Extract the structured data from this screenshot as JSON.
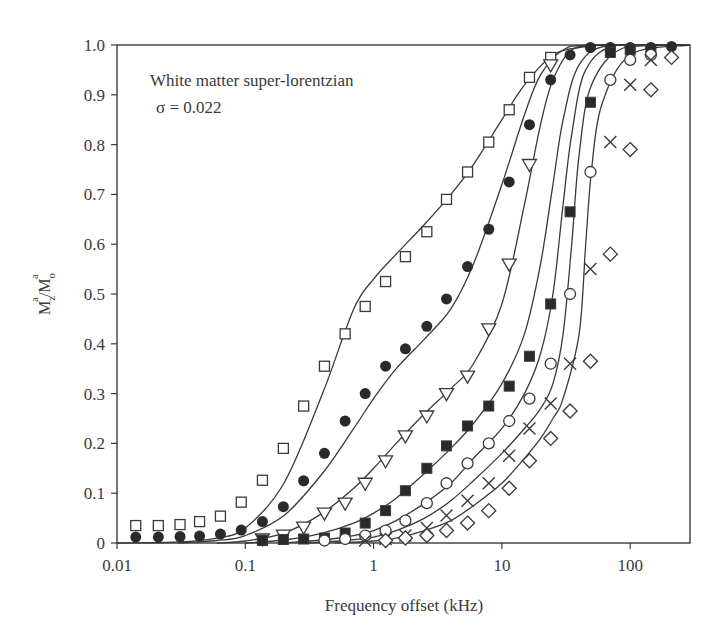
{
  "chart_data": {
    "type": "scatter",
    "title": "",
    "annotation": [
      "White matter super-lorentzian",
      "σ = 0.022"
    ],
    "xlabel": "Frequency offset (kHz)",
    "ylabel": "M_z^a/M_o^a",
    "xscale": "log",
    "xlim": [
      0.01,
      290
    ],
    "ylim": [
      0,
      1.0
    ],
    "xticks": [
      "0.01",
      "0.1",
      "1",
      "10",
      "100"
    ],
    "yticks": [
      "0",
      "0.1",
      "0.2",
      "0.3",
      "0.4",
      "0.5",
      "0.6",
      "0.7",
      "0.8",
      "0.9",
      "1.0"
    ],
    "grid": false,
    "legend": null,
    "series": [
      {
        "name": "open-square",
        "marker": "square-open",
        "x": [
          0.014,
          0.021,
          0.031,
          0.044,
          0.064,
          0.093,
          0.136,
          0.198,
          0.285,
          0.414,
          0.6,
          0.86,
          1.24,
          1.77,
          2.6,
          3.7,
          5.4,
          7.9,
          11.4,
          16.4,
          24
        ],
        "y": [
          0.035,
          0.035,
          0.037,
          0.043,
          0.054,
          0.082,
          0.126,
          0.19,
          0.275,
          0.355,
          0.42,
          0.475,
          0.525,
          0.575,
          0.625,
          0.69,
          0.745,
          0.805,
          0.87,
          0.935,
          0.975
        ]
      },
      {
        "name": "filled-circle",
        "marker": "circle-filled",
        "x": [
          0.014,
          0.021,
          0.031,
          0.044,
          0.064,
          0.093,
          0.136,
          0.198,
          0.285,
          0.414,
          0.6,
          0.86,
          1.24,
          1.77,
          2.6,
          3.7,
          5.4,
          7.9,
          11.4,
          16.4,
          24,
          34,
          49,
          70,
          100,
          145,
          210
        ],
        "y": [
          0.012,
          0.012,
          0.013,
          0.014,
          0.018,
          0.026,
          0.043,
          0.073,
          0.125,
          0.18,
          0.245,
          0.3,
          0.355,
          0.39,
          0.435,
          0.49,
          0.555,
          0.63,
          0.725,
          0.84,
          0.93,
          0.98,
          0.995,
          0.995,
          0.995,
          0.995,
          0.997
        ]
      },
      {
        "name": "open-triangle-down",
        "marker": "triangle-down-open",
        "x": [
          0.136,
          0.198,
          0.285,
          0.414,
          0.6,
          0.86,
          1.24,
          1.77,
          2.6,
          3.7,
          5.4,
          7.9,
          11.4,
          16.4,
          24
        ],
        "y": [
          0.008,
          0.016,
          0.032,
          0.06,
          0.08,
          0.12,
          0.165,
          0.215,
          0.255,
          0.3,
          0.335,
          0.43,
          0.56,
          0.76,
          0.96
        ]
      },
      {
        "name": "filled-square",
        "marker": "square-filled",
        "x": [
          0.136,
          0.198,
          0.285,
          0.414,
          0.6,
          0.86,
          1.24,
          1.77,
          2.6,
          3.7,
          5.4,
          7.9,
          11.4,
          16.4,
          24,
          34,
          49,
          70,
          100,
          145
        ],
        "y": [
          0.005,
          0.007,
          0.008,
          0.01,
          0.02,
          0.04,
          0.065,
          0.105,
          0.15,
          0.195,
          0.235,
          0.275,
          0.315,
          0.375,
          0.48,
          0.665,
          0.885,
          0.985,
          0.99,
          0.99
        ]
      },
      {
        "name": "open-circle",
        "marker": "circle-open",
        "x": [
          0.414,
          0.6,
          0.86,
          1.24,
          1.77,
          2.6,
          3.7,
          5.4,
          7.9,
          11.4,
          16.4,
          24,
          34,
          49,
          70,
          100,
          145
        ],
        "y": [
          0.005,
          0.008,
          0.015,
          0.025,
          0.045,
          0.08,
          0.12,
          0.16,
          0.2,
          0.245,
          0.29,
          0.36,
          0.5,
          0.745,
          0.93,
          0.97,
          0.98
        ]
      },
      {
        "name": "cross",
        "marker": "x",
        "x": [
          0.86,
          1.24,
          1.77,
          2.6,
          3.7,
          5.4,
          7.9,
          11.4,
          16.4,
          24,
          34,
          49,
          70,
          100,
          145
        ],
        "y": [
          0.005,
          0.008,
          0.015,
          0.03,
          0.055,
          0.085,
          0.12,
          0.175,
          0.23,
          0.28,
          0.36,
          0.55,
          0.805,
          0.92,
          0.97
        ]
      },
      {
        "name": "open-diamond",
        "marker": "diamond-open",
        "x": [
          1.24,
          1.77,
          2.6,
          3.7,
          5.4,
          7.9,
          11.4,
          16.4,
          24,
          34,
          49,
          70,
          100,
          145,
          210
        ],
        "y": [
          0.005,
          0.01,
          0.015,
          0.025,
          0.04,
          0.065,
          0.11,
          0.165,
          0.21,
          0.265,
          0.365,
          0.58,
          0.79,
          0.91,
          0.975
        ]
      }
    ],
    "fit_curves": [
      {
        "name": "fit-1",
        "x": [
          0.01,
          0.03,
          0.06,
          0.1,
          0.2,
          0.4,
          0.7,
          1,
          1.5,
          2.5,
          4,
          6,
          10,
          15,
          25,
          40,
          70,
          290
        ],
        "y": [
          0.0,
          0.002,
          0.01,
          0.03,
          0.12,
          0.3,
          0.47,
          0.53,
          0.58,
          0.64,
          0.7,
          0.76,
          0.85,
          0.92,
          0.98,
          0.995,
          1.0,
          1.0
        ]
      },
      {
        "name": "fit-2",
        "x": [
          0.03,
          0.06,
          0.1,
          0.2,
          0.4,
          0.7,
          1,
          1.5,
          2.5,
          4,
          6,
          10,
          15,
          20,
          30,
          50,
          290
        ],
        "y": [
          0.0,
          0.005,
          0.015,
          0.055,
          0.14,
          0.23,
          0.29,
          0.35,
          0.41,
          0.47,
          0.56,
          0.72,
          0.86,
          0.94,
          0.99,
          1.0,
          1.0
        ]
      },
      {
        "name": "fit-3",
        "x": [
          0.06,
          0.1,
          0.2,
          0.4,
          0.7,
          1,
          1.5,
          2.5,
          4,
          6,
          10,
          15,
          20,
          25,
          35,
          60,
          290
        ],
        "y": [
          0.0,
          0.004,
          0.02,
          0.06,
          0.11,
          0.15,
          0.2,
          0.26,
          0.31,
          0.36,
          0.48,
          0.68,
          0.84,
          0.93,
          0.99,
          1.0,
          1.0
        ]
      },
      {
        "name": "fit-4",
        "x": [
          0.1,
          0.2,
          0.4,
          0.7,
          1,
          1.5,
          2.5,
          4,
          6,
          10,
          15,
          20,
          25,
          30,
          40,
          70,
          290
        ],
        "y": [
          0.0,
          0.006,
          0.02,
          0.04,
          0.06,
          0.09,
          0.14,
          0.19,
          0.24,
          0.32,
          0.42,
          0.56,
          0.72,
          0.85,
          0.96,
          1.0,
          1.0
        ]
      },
      {
        "name": "fit-5",
        "x": [
          0.2,
          0.4,
          0.7,
          1,
          1.5,
          2.5,
          4,
          6,
          10,
          15,
          20,
          25,
          30,
          35,
          45,
          80,
          290
        ],
        "y": [
          0.0,
          0.006,
          0.015,
          0.025,
          0.045,
          0.08,
          0.12,
          0.17,
          0.23,
          0.3,
          0.38,
          0.5,
          0.68,
          0.82,
          0.95,
          1.0,
          1.0
        ]
      },
      {
        "name": "fit-6",
        "x": [
          0.3,
          0.6,
          1,
          1.5,
          2.5,
          4,
          6,
          10,
          15,
          20,
          25,
          30,
          35,
          40,
          50,
          90,
          290
        ],
        "y": [
          0.0,
          0.005,
          0.012,
          0.025,
          0.05,
          0.085,
          0.125,
          0.18,
          0.23,
          0.27,
          0.32,
          0.42,
          0.6,
          0.78,
          0.92,
          0.995,
          1.0
        ]
      },
      {
        "name": "fit-7",
        "x": [
          0.5,
          1,
          1.5,
          2.5,
          4,
          6,
          10,
          15,
          20,
          25,
          30,
          40,
          45,
          50,
          60,
          100,
          290
        ],
        "y": [
          0.0,
          0.004,
          0.01,
          0.025,
          0.045,
          0.075,
          0.12,
          0.17,
          0.21,
          0.25,
          0.29,
          0.42,
          0.6,
          0.75,
          0.88,
          0.98,
          1.0
        ]
      }
    ]
  }
}
